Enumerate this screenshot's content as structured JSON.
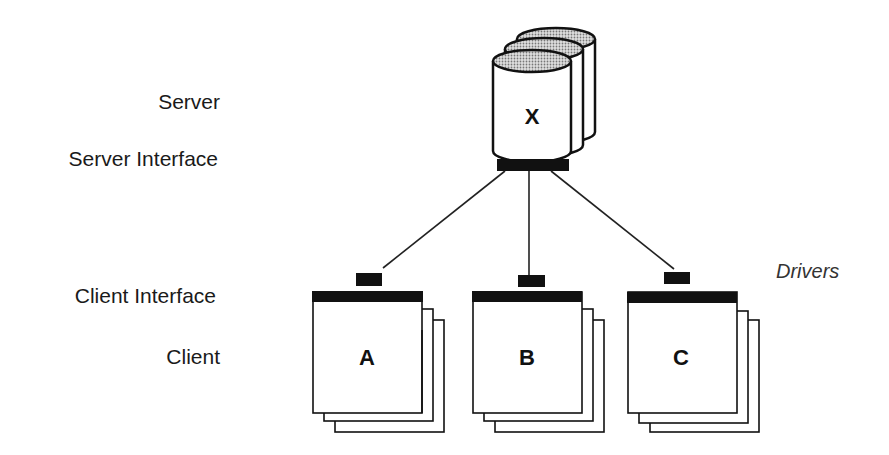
{
  "labels": {
    "server": "Server",
    "server_interface": "Server Interface",
    "client_interface": "Client Interface",
    "client": "Client",
    "drivers": "Drivers"
  },
  "server": {
    "letter": "X",
    "stack_count": 3,
    "top_fill": "#bdbdbd"
  },
  "clients": [
    {
      "letter": "A"
    },
    {
      "letter": "B"
    },
    {
      "letter": "C"
    }
  ],
  "colors": {
    "stroke": "#111111",
    "bar": "#111111",
    "background": "#ffffff"
  }
}
